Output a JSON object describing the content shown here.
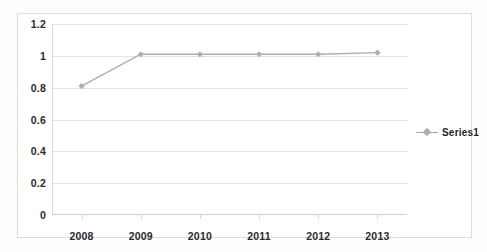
{
  "chart_data": {
    "type": "line",
    "title": "",
    "xlabel": "",
    "ylabel": "",
    "categories": [
      "2008",
      "2009",
      "2010",
      "2011",
      "2012",
      "2013"
    ],
    "series": [
      {
        "name": "Series1",
        "values": [
          0.81,
          1.01,
          1.01,
          1.01,
          1.01,
          1.02
        ],
        "color": "#a7b0b5",
        "marker": "diamond"
      }
    ],
    "ylim": [
      0,
      1.2
    ],
    "y_ticks": [
      "0",
      "0.2",
      "0.4",
      "0.6",
      "0.8",
      "1",
      "1.2"
    ],
    "y_tick_values": [
      0,
      0.2,
      0.4,
      0.6,
      0.8,
      1,
      1.2
    ],
    "grid": true,
    "grid_axis": "y",
    "legend": {
      "position": "right",
      "entries": [
        "Series1"
      ]
    }
  },
  "legend": {
    "series1_label": "Series1"
  },
  "axes": {
    "y_labels": [
      "1.2",
      "1",
      "0.8",
      "0.6",
      "0.4",
      "0.2",
      "0"
    ],
    "x_labels": [
      "2008",
      "2009",
      "2010",
      "2011",
      "2012",
      "2013"
    ]
  },
  "colors": {
    "series_line": "#a7b0b5",
    "gridline": "#e3e3e3",
    "chart_border": "#dcdcdc",
    "text": "#2b2b2b",
    "background": "#ffffff"
  }
}
